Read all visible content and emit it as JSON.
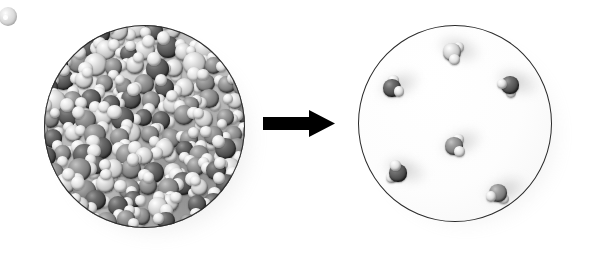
{
  "figure": {
    "title": "Liquid to gas phase change of water",
    "caption": "",
    "background_color": "#ffffff",
    "width": 589,
    "height": 253
  },
  "arrow": {
    "name": "transition-arrow",
    "direction": "right",
    "color": "#000000",
    "label": "",
    "x": 263,
    "y": 108,
    "width": 72,
    "height": 32
  },
  "panels": [
    {
      "id": "liquid",
      "label": "",
      "state": "liquid",
      "shape": "circle",
      "outline_color": "#2b2b2b",
      "fill_color": "#c4c4c4",
      "center_x": 144,
      "center_y": 126,
      "radius": 100,
      "molecule_count": 78,
      "description": "Densely packed water molecules touching one another"
    },
    {
      "id": "gas",
      "label": "",
      "state": "gas",
      "shape": "circle",
      "outline_color": "#2b2b2b",
      "fill_color": "#ffffff",
      "center_x": 455,
      "center_y": 123,
      "radius": 97,
      "molecule_count": 6,
      "description": "Six widely separated water molecules with motion blur trails"
    }
  ],
  "legend_atoms": [
    {
      "name": "oxygen-atom",
      "color": "#4c4c4c",
      "relative_size": 1.0
    },
    {
      "name": "hydrogen-atom",
      "color": "#e4e4e4",
      "relative_size": 0.62
    }
  ],
  "stray_sphere": {
    "name": "stray-sphere",
    "color": "#dadada",
    "x": -1,
    "y": 7,
    "size": 18
  },
  "gas_molecules": [
    {
      "id": 1,
      "cx": 452,
      "cy": 52,
      "angle": 18,
      "o_shade": "light"
    },
    {
      "id": 2,
      "cx": 392,
      "cy": 88,
      "angle": -25,
      "o_shade": "dark"
    },
    {
      "id": 3,
      "cx": 510,
      "cy": 85,
      "angle": 135,
      "o_shade": "dark"
    },
    {
      "id": 4,
      "cx": 454,
      "cy": 146,
      "angle": -5,
      "o_shade": "mid"
    },
    {
      "id": 5,
      "cx": 398,
      "cy": 173,
      "angle": 200,
      "o_shade": "dark"
    },
    {
      "id": 6,
      "cx": 498,
      "cy": 193,
      "angle": 100,
      "o_shade": "mid"
    }
  ],
  "chart_data": {
    "type": "diagram",
    "title": "Liquid to gas phase change of water",
    "categories": [
      "liquid",
      "gas"
    ],
    "values": [
      78,
      6
    ],
    "xlabel": "",
    "ylabel": "molecules visible in vessel",
    "annotations": [
      "arrow pointing right from liquid panel to gas panel"
    ]
  }
}
